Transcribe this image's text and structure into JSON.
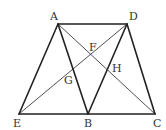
{
  "figure": {
    "type": "geometry-diagram",
    "stroke_color": "#222222",
    "points": [
      {
        "name": "A",
        "x": 58,
        "y": 24,
        "label": "A",
        "lx": 50,
        "ly": 20
      },
      {
        "name": "D",
        "x": 127,
        "y": 24,
        "label": "D",
        "lx": 129,
        "ly": 20
      },
      {
        "name": "E",
        "x": 19,
        "y": 114,
        "label": "E",
        "lx": 13,
        "ly": 127
      },
      {
        "name": "B",
        "x": 88,
        "y": 114,
        "label": "B",
        "lx": 84,
        "ly": 127
      },
      {
        "name": "C",
        "x": 155,
        "y": 114,
        "label": "C",
        "lx": 153,
        "ly": 127
      },
      {
        "name": "F",
        "x": 92,
        "y": 54,
        "label": "F",
        "lx": 89,
        "ly": 51
      },
      {
        "name": "G",
        "x": 74,
        "y": 71,
        "label": "G",
        "lx": 64,
        "ly": 84
      },
      {
        "name": "H",
        "x": 108,
        "y": 68,
        "label": "H",
        "lx": 112,
        "ly": 72
      }
    ],
    "segments": [
      {
        "from": "A",
        "to": "D",
        "weight": "thick"
      },
      {
        "from": "A",
        "to": "E",
        "weight": "thick"
      },
      {
        "from": "A",
        "to": "B",
        "weight": "thick"
      },
      {
        "from": "D",
        "to": "B",
        "weight": "thick"
      },
      {
        "from": "D",
        "to": "C",
        "weight": "thick"
      },
      {
        "from": "E",
        "to": "C",
        "weight": "thick"
      },
      {
        "from": "A",
        "to": "C",
        "weight": "thin"
      },
      {
        "from": "D",
        "to": "E",
        "weight": "thin"
      }
    ]
  }
}
